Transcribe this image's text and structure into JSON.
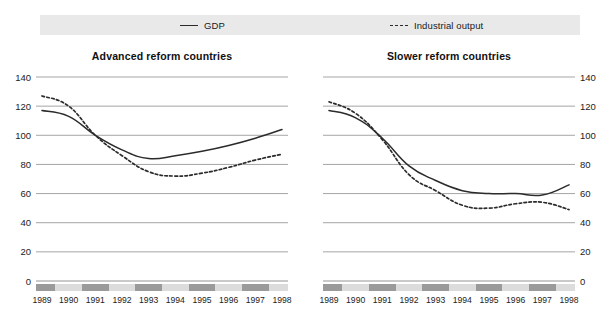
{
  "legend": {
    "items": [
      {
        "label": "GDP",
        "style": "solid",
        "color": "#2b2b2b",
        "icon": "solid-line-icon"
      },
      {
        "label": "Industrial output",
        "style": "dashed",
        "color": "#2b2b2b",
        "icon": "dashed-line-icon"
      }
    ]
  },
  "axis": {
    "y_ticks": [
      "140",
      "120",
      "100",
      "80",
      "60",
      "40",
      "20",
      "0"
    ],
    "x_ticks": [
      "1989",
      "1990",
      "1991",
      "1992",
      "1993",
      "1994",
      "1995",
      "1996",
      "1997",
      "1998"
    ]
  },
  "chart_data": [
    {
      "type": "line",
      "title": "Advanced reform countries",
      "xlabel": "",
      "ylabel": "",
      "x": [
        1989,
        1990,
        1991,
        1992,
        1993,
        1994,
        1995,
        1996,
        1997,
        1998
      ],
      "xtick_labels": [
        "1989",
        "1990",
        "1991",
        "1992",
        "1993",
        "1994",
        "1995",
        "1996",
        "1997",
        "1998"
      ],
      "ylim": [
        0,
        140
      ],
      "ytick_labels": [
        "0",
        "20",
        "40",
        "60",
        "80",
        "100",
        "120",
        "140"
      ],
      "grid": true,
      "legend_position": "top",
      "series": [
        {
          "name": "GDP",
          "style": "solid",
          "color": "#2b2b2b",
          "values": [
            117,
            113,
            100,
            90,
            84,
            86,
            89,
            93,
            98,
            104
          ]
        },
        {
          "name": "Industrial output",
          "style": "dashed",
          "color": "#2b2b2b",
          "values": [
            127,
            120,
            100,
            86,
            75,
            72,
            74,
            78,
            83,
            87
          ]
        }
      ]
    },
    {
      "type": "line",
      "title": "Slower reform countries",
      "xlabel": "",
      "ylabel": "",
      "x": [
        1989,
        1990,
        1991,
        1992,
        1993,
        1994,
        1995,
        1996,
        1997,
        1998
      ],
      "xtick_labels": [
        "1989",
        "1990",
        "1991",
        "1992",
        "1993",
        "1994",
        "1995",
        "1996",
        "1997",
        "1998"
      ],
      "ylim": [
        0,
        140
      ],
      "ytick_labels": [
        "0",
        "20",
        "40",
        "60",
        "80",
        "100",
        "120",
        "140"
      ],
      "grid": true,
      "legend_position": "top",
      "series": [
        {
          "name": "GDP",
          "style": "solid",
          "color": "#2b2b2b",
          "values": [
            117,
            112,
            98,
            79,
            69,
            62,
            60,
            60,
            59,
            66
          ]
        },
        {
          "name": "Industrial output",
          "style": "dashed",
          "color": "#2b2b2b",
          "values": [
            123,
            115,
            97,
            73,
            62,
            52,
            50,
            53,
            54,
            49
          ]
        }
      ]
    }
  ]
}
